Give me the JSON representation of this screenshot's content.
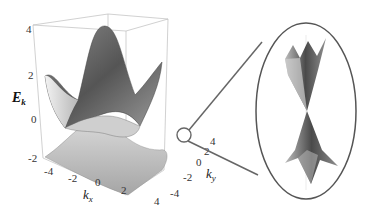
{
  "figure": {
    "type": "3d-surface-with-inset",
    "z_axis": {
      "label": "E",
      "label_sub": "k",
      "ticks": [
        "4",
        "2",
        "0",
        "-2"
      ]
    },
    "x_axis": {
      "label": "k",
      "label_sub": "x",
      "ticks": [
        "-4",
        "-2",
        "0",
        "2",
        "4"
      ]
    },
    "y_axis": {
      "label": "k",
      "label_sub": "y",
      "ticks": [
        "-4",
        "-2",
        "0",
        "2",
        "4"
      ]
    },
    "inset": {
      "description": "Zoomed Dirac cone where bands touch",
      "shape": "ellipse"
    },
    "colors": {
      "surface_dark": "#555555",
      "surface_light": "#e8e8e8",
      "box": "#bbbbbb",
      "callout": "#666666"
    }
  }
}
